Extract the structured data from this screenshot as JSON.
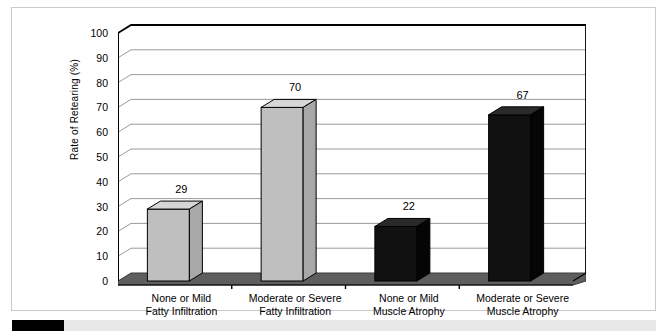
{
  "chart_data": {
    "type": "bar",
    "title": "",
    "subtitle": "",
    "xlabel": "",
    "ylabel": "Rate of Retearing (%)",
    "ylim": [
      0,
      100
    ],
    "ytick_step": 10,
    "yticks": [
      100,
      90,
      80,
      70,
      60,
      50,
      40,
      30,
      20,
      10,
      0
    ],
    "grid": true,
    "grid_axis": "y",
    "legend": false,
    "legend_position": "none",
    "style": "3d-column",
    "categories": [
      "None or Mild Fatty Infiltration",
      "Moderate or Severe Fatty Infiltration",
      "None or Mild Muscle Atrophy",
      "Moderate or Severe Muscle Atrophy"
    ],
    "category_lines": [
      [
        "None or Mild",
        "Fatty Infiltration"
      ],
      [
        "Moderate or Severe",
        "Fatty Infiltration"
      ],
      [
        "None or Mild",
        "Muscle Atrophy"
      ],
      [
        "Moderate or Severe",
        "Muscle Atrophy"
      ]
    ],
    "values": [
      29,
      70,
      22,
      67
    ],
    "value_labels": [
      "29",
      "70",
      "22",
      "67"
    ],
    "bar_colors": [
      "#bfbfbf",
      "#bfbfbf",
      "#111111",
      "#111111"
    ]
  },
  "colors": {
    "bar_light": "#bfbfbf",
    "bar_light_top": "#d6d6d6",
    "bar_light_side": "#a8a8a8",
    "bar_dark": "#111111",
    "bar_dark_top": "#2a2a2a",
    "bar_dark_side": "#050505",
    "floor": "#5e5e5e",
    "floor_top": "#8d8d8d",
    "gridline": "#9a9a9a",
    "axis": "#000000",
    "frame_border": "#c9c9c9",
    "footer_gray": "#e7e7e7",
    "footer_black": "#000000"
  },
  "footer": {
    "black_segment_label": "black-marker",
    "gray_segment_label": "gray-band"
  }
}
